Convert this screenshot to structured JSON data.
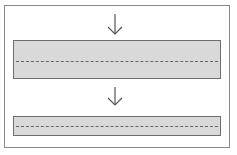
{
  "diagram": {
    "colors": {
      "frame_border": "#8a8a8a",
      "band_fill": "#d9d9d9",
      "band_border": "#6f6f6f",
      "dash": "#666666",
      "arrow": "#555555"
    },
    "elements": [
      {
        "type": "arrow",
        "direction": "down"
      },
      {
        "type": "band",
        "size": "thick",
        "centerline": "dashed"
      },
      {
        "type": "arrow",
        "direction": "down"
      },
      {
        "type": "band",
        "size": "thin",
        "centerline": "dashed"
      }
    ]
  }
}
